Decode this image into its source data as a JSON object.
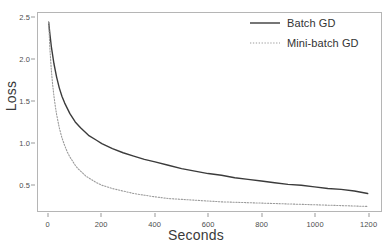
{
  "chart_data": {
    "type": "line",
    "title": "",
    "xlabel": "Seconds",
    "ylabel": "Loss",
    "xlim": [
      -40,
      1250
    ],
    "ylim": [
      0.18,
      2.56
    ],
    "grid": false,
    "legend_position": "top-right",
    "xticks": [
      0,
      200,
      400,
      600,
      800,
      1000,
      1200
    ],
    "xticklabels": [
      "0",
      "200",
      "400",
      "600",
      "800",
      "1000",
      "1200"
    ],
    "yticks": [
      0.5,
      1.0,
      1.5,
      2.0,
      2.5
    ],
    "yticklabels": [
      "0.5",
      "1.0",
      "1.5",
      "2.0",
      "2.5"
    ],
    "series": [
      {
        "name": "Batch GD",
        "style": "solid",
        "color": "#3b3b3b",
        "width": 1.4,
        "x": [
          0,
          5,
          10,
          20,
          30,
          40,
          50,
          60,
          80,
          100,
          120,
          150,
          180,
          200,
          240,
          280,
          320,
          360,
          400,
          450,
          500,
          550,
          600,
          650,
          700,
          750,
          800,
          850,
          900,
          950,
          1000,
          1050,
          1100,
          1150,
          1200
        ],
        "y": [
          2.45,
          2.3,
          2.16,
          1.95,
          1.79,
          1.66,
          1.56,
          1.48,
          1.35,
          1.25,
          1.18,
          1.09,
          1.03,
          0.99,
          0.93,
          0.88,
          0.84,
          0.8,
          0.77,
          0.73,
          0.69,
          0.66,
          0.63,
          0.61,
          0.58,
          0.56,
          0.54,
          0.52,
          0.5,
          0.49,
          0.47,
          0.45,
          0.44,
          0.42,
          0.39
        ]
      },
      {
        "name": "Mini-batch GD",
        "style": "dotted",
        "color": "#9b9b9b",
        "width": 1.1,
        "x": [
          0,
          5,
          10,
          15,
          20,
          25,
          30,
          40,
          50,
          60,
          70,
          80,
          90,
          100,
          110,
          120,
          140,
          160,
          180,
          200,
          240,
          280,
          320,
          360,
          400,
          450,
          500,
          550,
          600,
          650,
          700,
          750,
          800,
          850,
          900,
          950,
          1000,
          1050,
          1100,
          1150,
          1200
        ],
        "y": [
          2.45,
          2.12,
          1.88,
          1.7,
          1.56,
          1.44,
          1.34,
          1.18,
          1.06,
          0.97,
          0.89,
          0.83,
          0.78,
          0.73,
          0.69,
          0.66,
          0.6,
          0.56,
          0.52,
          0.49,
          0.45,
          0.42,
          0.39,
          0.37,
          0.35,
          0.33,
          0.32,
          0.31,
          0.3,
          0.29,
          0.285,
          0.28,
          0.275,
          0.27,
          0.265,
          0.26,
          0.255,
          0.25,
          0.245,
          0.24,
          0.235
        ]
      }
    ]
  },
  "axes": {
    "y_title": "Loss",
    "x_title": "Seconds"
  },
  "legend": {
    "items": [
      {
        "label": "Batch GD",
        "style": "solid"
      },
      {
        "label": "Mini-batch GD",
        "style": "dotted"
      }
    ]
  },
  "colors": {
    "batch_gd": "#3b3b3b",
    "mini_batch_gd": "#9b9b9b",
    "frame": "#b5b5b5",
    "text": "#4d4d4d",
    "background": "#ffffff"
  }
}
